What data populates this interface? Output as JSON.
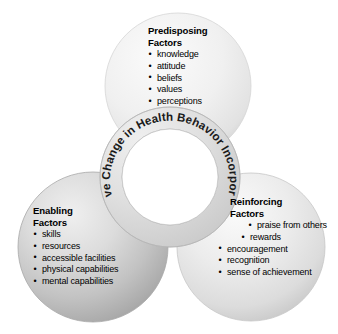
{
  "diagram": {
    "title": "Positive Change in Health Behavior Incorporates...",
    "background_color": "#ffffff",
    "center_ring": {
      "label": "Positive Change in Health Behavior Incorporates...",
      "fill_color": "#d9d9d9",
      "inner_color": "#ffffff",
      "stroke_color": "#b0b0b0"
    },
    "circles": [
      {
        "id": "predisposing",
        "position": "top",
        "title_line1": "Predisposing",
        "title_line2": "Factors",
        "fill_color": "#ededed",
        "edge_color": "#cfcfcf",
        "items": [
          "knowledge",
          "attitude",
          "beliefs",
          "values",
          "perceptions"
        ]
      },
      {
        "id": "enabling",
        "position": "bottom-left",
        "title_line1": "Enabling",
        "title_line2": "Factors",
        "fill_color": "#c8c8c8",
        "edge_color": "#a2a2a2",
        "items": [
          "skills",
          "resources",
          "accessible facilities",
          "physical capabilities",
          "mental capabilities"
        ]
      },
      {
        "id": "reinforcing",
        "position": "bottom-right",
        "title_line1": "Reinforcing",
        "title_line2": "Factors",
        "fill_color": "#e4e4e4",
        "edge_color": "#c4c4c4",
        "items": [
          "praise from others",
          "rewards",
          "encouragement",
          "recognition",
          "sense of achievement"
        ]
      }
    ]
  }
}
